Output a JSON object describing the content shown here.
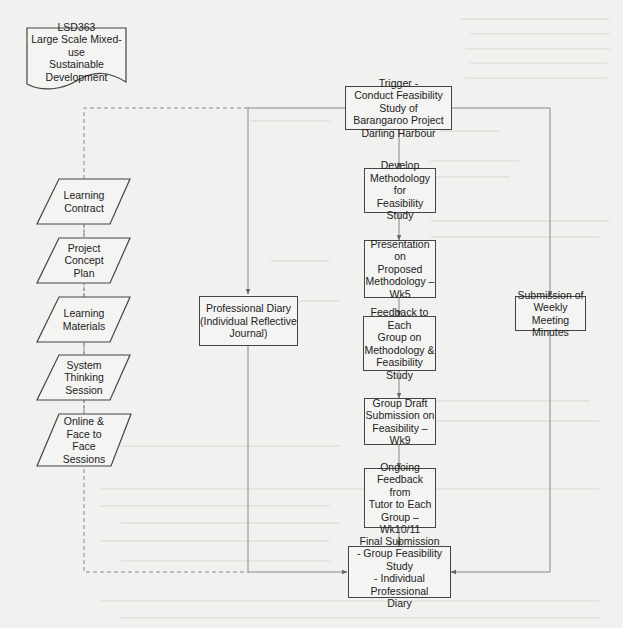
{
  "diagram": {
    "title_doc": {
      "lines": "LSD363\nLarge Scale Mixed-use\nSustainable Development"
    },
    "trigger": "Trigger -\nConduct Feasibility Study of\nBarangaroo Project\nDarling Harbour",
    "main_flow": [
      "Develop\nMethodology for\nFeasibility Study",
      "Presentation on\nProposed\nMethodology –\nWk5",
      "Feedback to Each\nGroup on\nMethodology &\nFeasibility Study",
      "Group Draft\nSubmission on\nFeasibility –\nWk9",
      "Ongoing\nFeedback from\nTutor to Each\nGroup –\nWk10/11"
    ],
    "final": "Final Submission\n- Group Feasibility Study\n- Individual Professional\nDiary",
    "professional_diary": "Professional Diary\n(Individual Reflective\nJournal)",
    "weekly_minutes": "Submission of\nWeekly Meeting\nMinutes",
    "inputs": [
      "Learning\nContract",
      "Project\nConcept\nPlan",
      "Learning\nMaterials",
      "System\nThinking\nSession",
      "Online &\nFace to\nFace\nSessions"
    ],
    "colors": {
      "stroke": "#444444",
      "connector": "#8a8a8a",
      "box_fill": "#f4f4f2",
      "background": "#f1f1ef"
    }
  }
}
